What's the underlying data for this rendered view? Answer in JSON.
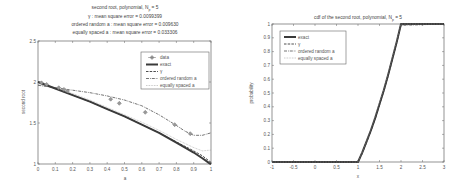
{
  "chart_data": [
    {
      "type": "line",
      "title_lines": [
        "second root, polynomial, N_p = 5",
        "γ : mean square error = 0.0099399",
        "ordered random a : mean square error = 0.009630",
        "equally spaced a : mean square error = 0.033306"
      ],
      "xlabel": "a",
      "ylabel": "second root",
      "xlim": [
        0,
        1
      ],
      "ylim": [
        1,
        2.5
      ],
      "xticks": [
        "0",
        "0.1",
        "0.2",
        "0.3",
        "0.4",
        "0.5",
        "0.6",
        "0.7",
        "0.8",
        "0.9",
        "1"
      ],
      "yticks": [
        "1",
        "1.5",
        "2",
        "2.5"
      ],
      "grid": false,
      "legend_position": "upper right",
      "legend": [
        "data",
        "exact",
        "γ",
        "ordered random a",
        "equally spaced a"
      ],
      "series": [
        {
          "name": "data",
          "style": "diamond markers",
          "x": [
            0.02,
            0.05,
            0.12,
            0.15,
            0.17,
            0.42,
            0.47,
            0.62,
            0.79,
            0.88
          ],
          "y": [
            1.99,
            1.97,
            1.93,
            1.91,
            1.89,
            1.79,
            1.74,
            1.63,
            1.48,
            1.37
          ]
        },
        {
          "name": "exact",
          "style": "thick solid",
          "x": [
            0,
            0.1,
            0.2,
            0.3,
            0.4,
            0.5,
            0.6,
            0.7,
            0.8,
            0.9,
            0.95,
            0.99,
            1.0
          ],
          "y": [
            2.0,
            1.92,
            1.84,
            1.76,
            1.67,
            1.58,
            1.48,
            1.38,
            1.26,
            1.14,
            1.07,
            1.01,
            1.0
          ]
        },
        {
          "name": "γ",
          "style": "dashed",
          "x": [
            0,
            0.1,
            0.2,
            0.3,
            0.4,
            0.5,
            0.6,
            0.7,
            0.8,
            0.9,
            0.95,
            1.0
          ],
          "y": [
            2.0,
            1.92,
            1.84,
            1.76,
            1.67,
            1.58,
            1.48,
            1.38,
            1.27,
            1.16,
            1.1,
            1.02
          ]
        },
        {
          "name": "ordered random a",
          "style": "dash-dot",
          "x": [
            0,
            0.1,
            0.2,
            0.3,
            0.4,
            0.5,
            0.6,
            0.7,
            0.8,
            0.85,
            0.9,
            0.95,
            1.0
          ],
          "y": [
            1.96,
            1.93,
            1.9,
            1.87,
            1.83,
            1.78,
            1.71,
            1.6,
            1.47,
            1.4,
            1.35,
            1.35,
            1.38
          ]
        },
        {
          "name": "equally spaced a",
          "style": "dotted",
          "x": [
            0,
            0.1,
            0.2,
            0.3,
            0.4,
            0.5,
            0.6,
            0.7,
            0.8,
            0.9,
            0.95,
            1.0
          ],
          "y": [
            1.97,
            1.93,
            1.86,
            1.78,
            1.69,
            1.6,
            1.51,
            1.41,
            1.3,
            1.2,
            1.16,
            1.17
          ]
        }
      ]
    },
    {
      "type": "line",
      "title": "cdf of the second root, polynomial, N_p = 5",
      "xlabel": "x",
      "ylabel": "probability",
      "xlim": [
        -1,
        3
      ],
      "ylim": [
        0,
        1
      ],
      "xticks": [
        "-1",
        "-0.5",
        "0",
        "0.5",
        "1",
        "1.5",
        "2",
        "2.5",
        "3"
      ],
      "yticks": [
        "0",
        "0.1",
        "0.2",
        "0.3",
        "0.4",
        "0.5",
        "0.6",
        "0.7",
        "0.8",
        "0.9",
        "1"
      ],
      "grid": false,
      "legend_position": "upper left",
      "legend": [
        "exact",
        "γ",
        "ordered random a",
        "equally spaced a"
      ],
      "series": [
        {
          "name": "exact",
          "style": "thick solid",
          "x": [
            -1,
            1.0,
            1.1,
            1.2,
            1.3,
            1.4,
            1.5,
            1.6,
            1.7,
            1.8,
            1.9,
            2.0,
            3.0
          ],
          "y": [
            0,
            0,
            0.07,
            0.15,
            0.23,
            0.32,
            0.42,
            0.52,
            0.63,
            0.75,
            0.87,
            1.0,
            1.0
          ]
        },
        {
          "name": "γ",
          "style": "dashed",
          "x": [
            -1,
            1.0,
            1.1,
            1.2,
            1.3,
            1.4,
            1.5,
            1.6,
            1.7,
            1.8,
            1.9,
            2.0,
            3.0
          ],
          "y": [
            0,
            0,
            0.07,
            0.15,
            0.23,
            0.32,
            0.42,
            0.52,
            0.63,
            0.75,
            0.87,
            1.0,
            1.0
          ]
        },
        {
          "name": "ordered random a",
          "style": "dash-dot",
          "x": [
            -1,
            1.0,
            1.1,
            1.2,
            1.3,
            1.4,
            1.5,
            1.6,
            1.7,
            1.8,
            1.9,
            2.0,
            3.0
          ],
          "y": [
            0,
            0,
            0.06,
            0.14,
            0.22,
            0.31,
            0.41,
            0.51,
            0.62,
            0.74,
            0.86,
            0.99,
            1.0
          ]
        },
        {
          "name": "equally spaced a",
          "style": "dotted",
          "x": [
            -1,
            1.0,
            1.1,
            1.2,
            1.3,
            1.4,
            1.5,
            1.6,
            1.7,
            1.8,
            1.9,
            2.0,
            3.0
          ],
          "y": [
            0,
            0,
            0.07,
            0.15,
            0.24,
            0.33,
            0.43,
            0.53,
            0.64,
            0.76,
            0.88,
            1.0,
            1.0
          ]
        }
      ]
    }
  ],
  "left": {
    "title": {
      "line1": "second root, polynomial, N",
      "line1_sub": "p",
      "line1_tail": " = 5",
      "line2": "γ : mean square error = 0.0099399",
      "line3": "ordered random a : mean square error = 0.009630",
      "line4": "equally spaced a : mean square error = 0.033306"
    },
    "xlabel": "a",
    "ylabel": "second root",
    "legend": {
      "data": "data",
      "exact": "exact",
      "gamma": "γ",
      "ordered": "ordered random a",
      "equally": "equally spaced a"
    }
  },
  "right": {
    "title": {
      "main": "cdf of the second root, polynomial, N",
      "sub": "p",
      "tail": " = 5"
    },
    "xlabel": "x",
    "ylabel": "probability",
    "legend": {
      "exact": "exact",
      "gamma": "γ",
      "ordered": "ordered random a",
      "equally": "equally spaced a"
    }
  },
  "colors": {
    "line": "#3a3a3a",
    "marker": "#8a8a8a",
    "axis": "#666666",
    "text": "#555555"
  }
}
